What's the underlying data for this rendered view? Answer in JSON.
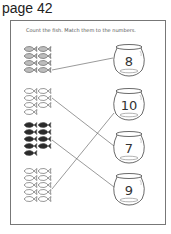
{
  "page": {
    "label": "page 42"
  },
  "worksheet": {
    "instruction": "Count the fish. Match them to the numbers.",
    "fish_groups": [
      {
        "count": 8,
        "color": "grey",
        "matched_number": "8"
      },
      {
        "count": 7,
        "color": "white",
        "matched_number": "7"
      },
      {
        "count": 9,
        "color": "black",
        "matched_number": "9"
      },
      {
        "count": 10,
        "color": "white",
        "matched_number": "10"
      }
    ],
    "bowls": [
      {
        "number": "8"
      },
      {
        "number": "10"
      },
      {
        "number": "7"
      },
      {
        "number": "9"
      }
    ]
  }
}
